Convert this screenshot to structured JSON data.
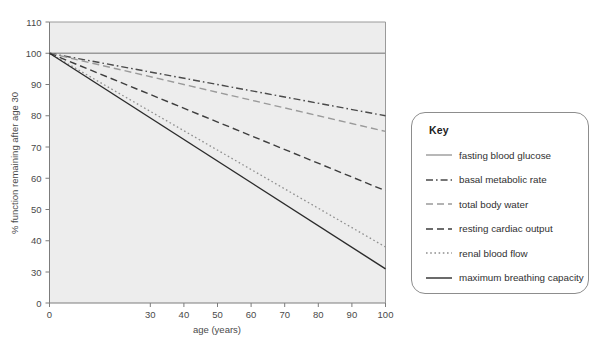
{
  "chart_data": {
    "type": "line",
    "title": "",
    "xlabel": "age (years)",
    "ylabel": "% function remaining after age 30",
    "xlim": [
      0,
      100
    ],
    "ylim": [
      0,
      110
    ],
    "xticks": [
      "0",
      "30",
      "40",
      "50",
      "60",
      "70",
      "80",
      "90",
      "100"
    ],
    "yticks": [
      "0",
      "30",
      "40",
      "50",
      "60",
      "70",
      "80",
      "90",
      "100",
      "110"
    ],
    "grid": false,
    "legend_position": "right-outside",
    "x": [
      0,
      100
    ],
    "series": [
      {
        "name": "fasting blood glucose",
        "style": "solid",
        "color": "#9a9a9a",
        "values": [
          100,
          100
        ]
      },
      {
        "name": "basal metabolic rate",
        "style": "dash-dot",
        "color": "#4a4a4a",
        "values": [
          100,
          80
        ]
      },
      {
        "name": "total body water",
        "style": "dashed",
        "color": "#9a9a9a",
        "values": [
          100,
          75
        ]
      },
      {
        "name": "resting cardiac output",
        "style": "dashed",
        "color": "#3d3d3d",
        "values": [
          100,
          56
        ]
      },
      {
        "name": "renal blood flow",
        "style": "dotted",
        "color": "#8f8f8f",
        "values": [
          100,
          38
        ]
      },
      {
        "name": "maximum breathing capacity",
        "style": "solid",
        "color": "#2b2b2b",
        "values": [
          100,
          31
        ]
      }
    ]
  },
  "legend": {
    "title": "Key",
    "items": [
      {
        "label": "fasting blood glucose"
      },
      {
        "label": "basal metabolic rate"
      },
      {
        "label": "total body water"
      },
      {
        "label": "resting cardiac output"
      },
      {
        "label": "renal blood flow"
      },
      {
        "label": "maximum breathing capacity"
      }
    ]
  },
  "colors": {
    "plot_background": "#ededed",
    "axis": "#7c7c7c",
    "text": "#3a3a3a"
  }
}
